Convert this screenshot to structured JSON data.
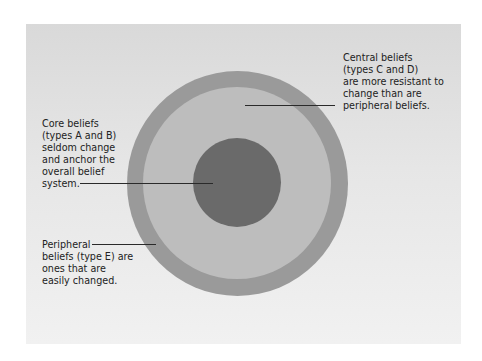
{
  "diagram": {
    "type": "concentric-circles",
    "colors": {
      "background": "#ffffff",
      "panel": "#e2e2e2",
      "outer_ring": "#9a9a9a",
      "middle_ring": "#bdbdbd",
      "core": "#6a6a6a",
      "text": "#222222"
    },
    "labels": {
      "central": "Central beliefs\n(types C and D)\nare more resistant to\nchange than are\nperipheral beliefs.",
      "core": "Core beliefs\n(types A and B)\nseldom change\nand anchor the\noverall belief\nsystem.",
      "peripheral": "Peripheral\nbeliefs (type E) are\nones that are\neasily changed."
    }
  }
}
